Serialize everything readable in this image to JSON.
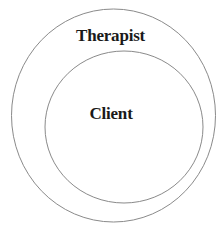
{
  "diagram": {
    "type": "nested-circles",
    "outer": {
      "label": "Therapist",
      "stroke": "#8a8a8a"
    },
    "inner": {
      "label": "Client",
      "stroke": "#8a8a8a"
    }
  }
}
